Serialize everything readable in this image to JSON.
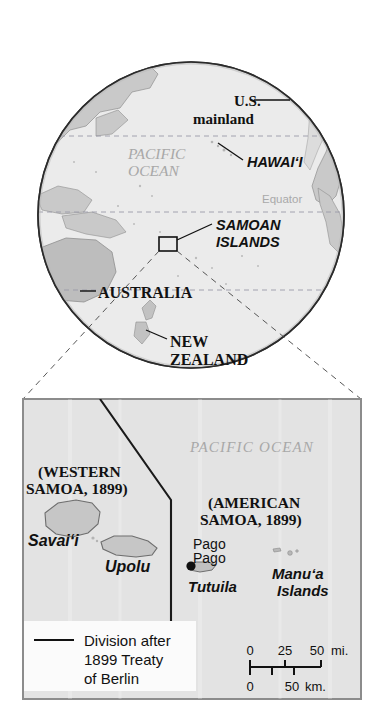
{
  "figure": {
    "background_color": "#ffffff"
  },
  "globe": {
    "ocean_label_line1": "PACIFIC",
    "ocean_label_line2": "OCEAN",
    "equator_label": "Equator",
    "labels": {
      "us_mainland_line1": "U.S.",
      "us_mainland_line2": "mainland",
      "hawaii": "HAWAI‘I",
      "samoan_islands_line1": "SAMOAN",
      "samoan_islands_line2": "ISLANDS",
      "australia": "AUSTRALIA",
      "new_zealand_line1": "NEW",
      "new_zealand_line2": "ZEALAND"
    },
    "colors": {
      "ocean_fill": "#ebebeb",
      "land_fill": "#c9c9c9",
      "outline": "#333333",
      "latitude_line": "#9a9aa8"
    }
  },
  "inset": {
    "ocean_label": "PACIFIC OCEAN",
    "western_samoa_line1": "(WESTERN",
    "western_samoa_line2": "SAMOA, 1899)",
    "american_samoa_line1": "(AMERICAN",
    "american_samoa_line2": "SAMOA, 1899)",
    "islands": {
      "savaii": "Savai‘i",
      "upolu": "Upolu",
      "tutuila": "Tutuila",
      "manua_line1": "Manu‘a",
      "manua_line2": "Islands"
    },
    "city": {
      "pago_pago_line1": "Pago",
      "pago_pago_line2": "Pago"
    },
    "colors": {
      "ocean_fill": "#e3e3e3",
      "land_fill": "#c6c6c6",
      "border": "#8c8c8c",
      "division_line": "#1a1a1a"
    }
  },
  "legend": {
    "line1": "Division after",
    "line2": "1899 Treaty",
    "line3": "of Berlin"
  },
  "scale_bar": {
    "miles": {
      "ticks": [
        "0",
        "25",
        "50"
      ],
      "unit": "mi."
    },
    "kilometers": {
      "ticks": [
        "0",
        "50"
      ],
      "unit": "km."
    }
  }
}
